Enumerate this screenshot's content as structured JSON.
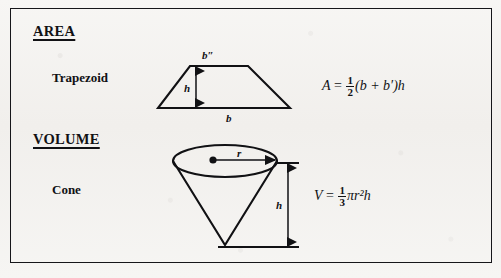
{
  "page": {
    "background_color": "#f4f3f1",
    "border_color": "#16161a"
  },
  "sections": [
    {
      "id": "area",
      "heading": "AREA",
      "shape_label": "Trapezoid",
      "figure": {
        "name": "trapezoid",
        "labels": {
          "top_base": "b″",
          "bottom_base": "b",
          "height": "h"
        }
      },
      "formula": {
        "lhs": "A",
        "equals": "=",
        "fraction_numerator": "1",
        "fraction_denominator": "2",
        "rhs_tail": "(b + b′)h",
        "plain": "A = 1/2 (b + b′)h"
      }
    },
    {
      "id": "volume",
      "heading": "VOLUME",
      "shape_label": "Cone",
      "figure": {
        "name": "cone",
        "labels": {
          "radius": "r",
          "height": "h"
        }
      },
      "formula": {
        "lhs": "V",
        "equals": "=",
        "fraction_numerator": "1",
        "fraction_denominator": "3",
        "rhs_tail": "πr²h",
        "plain": "V = 1/3 πr²h"
      }
    }
  ]
}
